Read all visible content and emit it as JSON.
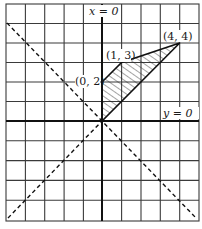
{
  "diagram": {
    "type": "coordinate-grid",
    "grid": {
      "cols": 10,
      "rows": 11,
      "cell_px": 19.4
    },
    "origin_px": {
      "x": 102,
      "y": 121
    },
    "axes": {
      "vertical_label": "x = 0",
      "horizontal_label": "y = 0"
    },
    "dashed_lines": [
      {
        "name": "line y = x",
        "from": [
          -5,
          -5
        ],
        "to": [
          5,
          5
        ]
      },
      {
        "name": "line y = -x",
        "from": [
          -5,
          6
        ],
        "to": [
          5,
          -5
        ]
      }
    ],
    "shaded_region": {
      "vertices": [
        [
          0,
          0
        ],
        [
          0,
          2
        ],
        [
          1,
          3
        ],
        [
          4,
          4
        ]
      ],
      "fill": "hatched"
    },
    "points": [
      {
        "label": "(0, 2)",
        "x": 0,
        "y": 2
      },
      {
        "label": "(1, 3)",
        "x": 1,
        "y": 3
      },
      {
        "label": "(4, 4)",
        "x": 4,
        "y": 4
      }
    ],
    "colors": {
      "ink": "#1a1a1a",
      "grid": "#333333",
      "background": "#ffffff"
    }
  }
}
